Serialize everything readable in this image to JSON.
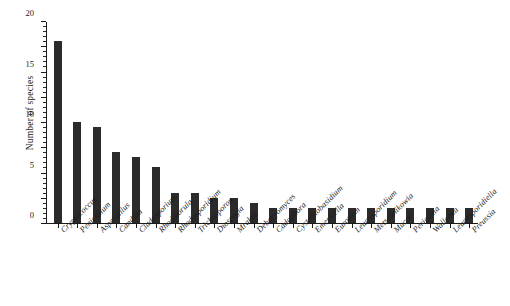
{
  "chart_data": {
    "type": "bar",
    "title": "",
    "xlabel": "",
    "ylabel": "Number of species",
    "ylim": [
      0,
      40
    ],
    "ytick_step": 5,
    "yminor_step": 1,
    "grid": false,
    "legend": null,
    "bar_color": "#2b2b2b",
    "categories": [
      "Cryptococcus",
      "Penicillium",
      "Aspergillus",
      "Candida",
      "Cladosporium",
      "Rhodotorula",
      "Rhodosporidium",
      "Trichosporon",
      "Dioszegia",
      "Mrakia",
      "Debaryomyces",
      "Cadophora",
      "Cystofilobasidium",
      "Emericella",
      "Eurotium",
      "Leucosporidium",
      "Metschnikowia",
      "Mucor",
      "Periconia",
      "Wallemia",
      "Leucosporidiella",
      "Preussia"
    ],
    "values": [
      36,
      20,
      19,
      14,
      13,
      11,
      6,
      6,
      5,
      5,
      4,
      3,
      3,
      3,
      3,
      3,
      3,
      3,
      3,
      3,
      3,
      3
    ],
    "yticks": [
      "0",
      "5",
      "10",
      "15",
      "20",
      "25",
      "30",
      "35",
      "40"
    ]
  }
}
